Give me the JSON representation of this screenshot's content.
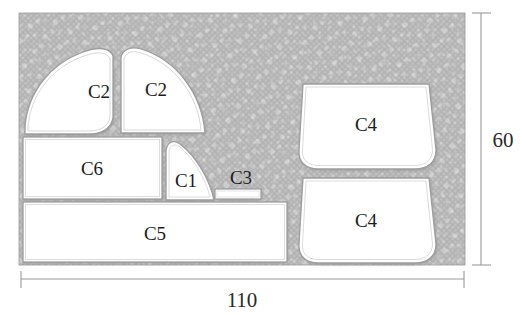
{
  "figure": {
    "type": "nesting-layout-diagram",
    "title": "",
    "sheet": {
      "width_label": "110",
      "height_label": "60",
      "fill_color": "#b9b9b9",
      "texture": "speckled-diagonal"
    },
    "part_fill_color": "#ffffff",
    "part_stroke_color": "#8c8c8c",
    "label_color": "#1b1b1b"
  },
  "parts": [
    {
      "id": "c2-left",
      "label": "C2",
      "shape": "quarter-leaf",
      "cx": 99,
      "cy": 98
    },
    {
      "id": "c2-right",
      "label": "C2",
      "shape": "quarter-disc",
      "cx": 156,
      "cy": 96
    },
    {
      "id": "c6",
      "label": "C6",
      "shape": "rectangle",
      "cx": 92,
      "cy": 168
    },
    {
      "id": "c1",
      "label": "C1",
      "shape": "leaf",
      "cx": 186,
      "cy": 180
    },
    {
      "id": "c3",
      "label": "C3",
      "shape": "thin-bar",
      "cx": 242,
      "cy": 177
    },
    {
      "id": "c5",
      "label": "C5",
      "shape": "rectangle",
      "cx": 155,
      "cy": 234
    },
    {
      "id": "c4-top",
      "label": "C4",
      "shape": "rounded-trapezoid",
      "cx": 366,
      "cy": 126
    },
    {
      "id": "c4-bottom",
      "label": "C4",
      "shape": "rounded-trapezoid",
      "cx": 366,
      "cy": 222
    }
  ],
  "dimensions": {
    "width": {
      "value": "110",
      "orientation": "horizontal",
      "position": "bottom"
    },
    "height": {
      "value": "60",
      "orientation": "vertical",
      "position": "right"
    }
  }
}
